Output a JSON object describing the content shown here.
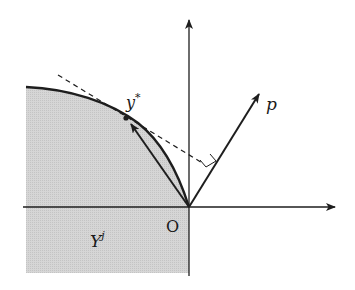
{
  "diagram": {
    "labels": {
      "optimum": "y",
      "optimum_superscript": "*",
      "price_vector": "p",
      "origin": "O",
      "set": "Y",
      "set_superscript": "j"
    },
    "colors": {
      "shade": "#d2d2d2",
      "stroke": "#1e1e1e",
      "background": "#ffffff"
    },
    "elements": [
      "x-axis with arrow",
      "y-axis with arrow",
      "shaded production set Y^j",
      "boundary curve",
      "dashed supporting tangent line at y*",
      "price vector p from origin",
      "right-angle marker between tangent and p",
      "chord arrow from O to y*"
    ]
  }
}
